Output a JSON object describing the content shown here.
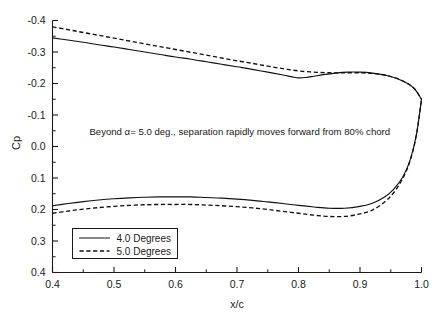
{
  "chart_data": {
    "type": "line",
    "title": "",
    "xlabel": "x/c",
    "ylabel": "Cp",
    "xlim": [
      0.4,
      1.0
    ],
    "ylim": [
      0.4,
      -0.4
    ],
    "y_inverted": true,
    "grid": false,
    "legend_position": "lower-left",
    "xticks": [
      "0.4",
      "0.5",
      "0.6",
      "0.7",
      "0.8",
      "0.9",
      "1.0"
    ],
    "xtick_values": [
      0.4,
      0.5,
      0.6,
      0.7,
      0.8,
      0.9,
      1.0
    ],
    "xminor_step": 0.05,
    "yticks": [
      "-0.4",
      "-0.3",
      "-0.2",
      "-0.1",
      "0.0",
      "0.1",
      "0.2",
      "0.3",
      "0.4"
    ],
    "ytick_values": [
      -0.4,
      -0.3,
      -0.2,
      -0.1,
      0.0,
      0.1,
      0.2,
      0.3,
      0.4
    ],
    "yminor_step": 0.05,
    "annotations": [
      {
        "text": "Beyond α= 5.0 deg., separation rapidly moves forward from 80% chord",
        "x": 0.46,
        "y": -0.035
      }
    ],
    "series": [
      {
        "name": "4.0 Degrees",
        "style": "solid",
        "color": "#111111",
        "upper_surface": {
          "x": [
            0.4,
            0.425,
            0.45,
            0.475,
            0.5,
            0.525,
            0.55,
            0.575,
            0.6,
            0.625,
            0.65,
            0.675,
            0.7,
            0.725,
            0.75,
            0.775,
            0.79,
            0.8,
            0.812,
            0.825,
            0.84,
            0.86,
            0.88,
            0.9,
            0.92,
            0.94,
            0.96,
            0.98,
            0.99,
            1.0
          ],
          "y": [
            -0.345,
            -0.338,
            -0.331,
            -0.323,
            -0.316,
            -0.308,
            -0.3,
            -0.292,
            -0.284,
            -0.277,
            -0.269,
            -0.261,
            -0.253,
            -0.245,
            -0.236,
            -0.227,
            -0.221,
            -0.218,
            -0.219,
            -0.223,
            -0.228,
            -0.233,
            -0.236,
            -0.236,
            -0.233,
            -0.227,
            -0.216,
            -0.197,
            -0.18,
            -0.15
          ]
        },
        "lower_surface": {
          "x": [
            0.4,
            0.425,
            0.45,
            0.475,
            0.5,
            0.525,
            0.55,
            0.575,
            0.6,
            0.625,
            0.65,
            0.675,
            0.7,
            0.725,
            0.75,
            0.775,
            0.8,
            0.825,
            0.85,
            0.875,
            0.9,
            0.92,
            0.94,
            0.955,
            0.97,
            0.982,
            0.992,
            1.0
          ],
          "y": [
            0.188,
            0.181,
            0.175,
            0.17,
            0.166,
            0.163,
            0.161,
            0.16,
            0.16,
            0.16,
            0.162,
            0.164,
            0.167,
            0.171,
            0.176,
            0.181,
            0.187,
            0.192,
            0.196,
            0.196,
            0.19,
            0.18,
            0.16,
            0.135,
            0.095,
            0.04,
            -0.04,
            -0.15
          ]
        }
      },
      {
        "name": "5.0 Degrees",
        "style": "dashed",
        "color": "#111111",
        "upper_surface": {
          "x": [
            0.4,
            0.425,
            0.45,
            0.475,
            0.5,
            0.525,
            0.55,
            0.575,
            0.6,
            0.625,
            0.65,
            0.675,
            0.7,
            0.725,
            0.75,
            0.775,
            0.8,
            0.825,
            0.85,
            0.875,
            0.9,
            0.92,
            0.94,
            0.96,
            0.98,
            0.99,
            1.0
          ],
          "y": [
            -0.38,
            -0.371,
            -0.362,
            -0.353,
            -0.344,
            -0.335,
            -0.326,
            -0.317,
            -0.308,
            -0.299,
            -0.29,
            -0.281,
            -0.272,
            -0.264,
            -0.255,
            -0.247,
            -0.24,
            -0.236,
            -0.234,
            -0.234,
            -0.234,
            -0.232,
            -0.227,
            -0.216,
            -0.197,
            -0.18,
            -0.15
          ]
        },
        "lower_surface": {
          "x": [
            0.4,
            0.425,
            0.45,
            0.475,
            0.5,
            0.525,
            0.55,
            0.575,
            0.6,
            0.625,
            0.65,
            0.675,
            0.7,
            0.725,
            0.75,
            0.775,
            0.8,
            0.825,
            0.85,
            0.875,
            0.9,
            0.92,
            0.94,
            0.955,
            0.97,
            0.982,
            0.992,
            1.0
          ],
          "y": [
            0.212,
            0.205,
            0.199,
            0.194,
            0.19,
            0.187,
            0.185,
            0.184,
            0.184,
            0.184,
            0.186,
            0.188,
            0.191,
            0.195,
            0.2,
            0.206,
            0.212,
            0.218,
            0.222,
            0.222,
            0.214,
            0.202,
            0.176,
            0.146,
            0.1,
            0.042,
            -0.04,
            -0.15
          ]
        }
      }
    ]
  },
  "legend": {
    "entries": [
      {
        "label": "4.0 Degrees",
        "style": "solid"
      },
      {
        "label": "5.0 Degrees",
        "style": "dashed"
      }
    ]
  },
  "axes": {
    "x_title": "x/c",
    "y_title": "Cp"
  }
}
